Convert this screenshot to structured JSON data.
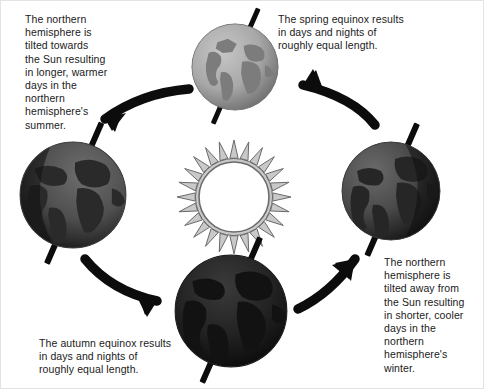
{
  "diagram": {
    "background_color": "#ffffff",
    "border_color": "#e3e3e3"
  },
  "captions": {
    "summer": "The northern\nhemisphere is\ntilted towards\nthe Sun resulting\nin longer, warmer\ndays in the\nnorthern\nhemisphere's\nsummer.",
    "spring": "The spring equinox results\nin days and nights of\nroughly equal length.",
    "winter": "The northern\nhemisphere is\ntilted away from\nthe Sun resulting\nin shorter, cooler\ndays in the\nnorthern\nhemisphere's\nwinter.",
    "autumn": "The autumn equinox results\nin days and nights of\nroughly equal length."
  },
  "sun": {
    "label": "sun",
    "disc_color": "#ffffff",
    "ray_fill": "#c9c9c9",
    "ray_stroke": "#6b6b6b",
    "ray_count": 24,
    "center_x": 233,
    "center_y": 196,
    "disc_radius": 38,
    "ray_outer_radius": 57
  },
  "globes": [
    {
      "id": "globe-top",
      "position": "top",
      "season_label": "spring equinox",
      "ocean_color": "#a8a8a8",
      "land_color": "#7c7c7c",
      "shadow_color": "#6f6f6f",
      "diameter": 88,
      "x": 190,
      "y": 22
    },
    {
      "id": "globe-left",
      "position": "left",
      "season_label": "northern summer",
      "ocean_color": "#4f4f4f",
      "land_color": "#2a2a2a",
      "shadow_color": "#151515",
      "diameter": 108,
      "x": 18,
      "y": 140
    },
    {
      "id": "globe-right",
      "position": "right",
      "season_label": "northern winter",
      "ocean_color": "#4a4a4a",
      "land_color": "#262626",
      "shadow_color": "#121212",
      "diameter": 100,
      "x": 340,
      "y": 140
    },
    {
      "id": "globe-bottom",
      "position": "bottom",
      "season_label": "autumn equinox",
      "ocean_color": "#232323",
      "land_color": "#121212",
      "shadow_color": "#060606",
      "diameter": 114,
      "x": 173,
      "y": 253
    }
  ],
  "orbit_arrows": [
    {
      "id": "arrow-top-to-left",
      "from": "globe-top",
      "to": "globe-left",
      "direction": "down-left",
      "color": "#0c0c0c"
    },
    {
      "id": "arrow-left-to-bottom",
      "from": "globe-left",
      "to": "globe-bottom",
      "direction": "down-right",
      "color": "#0c0c0c"
    },
    {
      "id": "arrow-bottom-to-right",
      "from": "globe-bottom",
      "to": "globe-right",
      "direction": "up-right",
      "color": "#0c0c0c"
    },
    {
      "id": "arrow-right-to-top",
      "from": "globe-right",
      "to": "globe-top",
      "direction": "up-left",
      "color": "#0c0c0c"
    }
  ],
  "axis": {
    "label": "rotational axis",
    "color": "#0c0c0c",
    "tilt_degrees": 23.5
  }
}
